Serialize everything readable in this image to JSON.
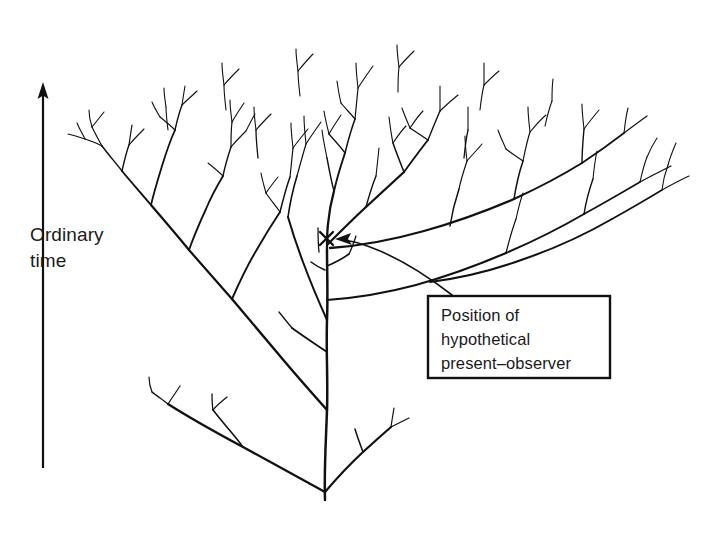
{
  "figure": {
    "background_color": "#ffffff",
    "ink_color": "#111111",
    "width": 712,
    "height": 537
  },
  "time_axis": {
    "label": "Ordinary\ntime",
    "label_line_1": "Ordinary",
    "label_line_2": "time",
    "direction": "upward",
    "arrow_icon": "up-arrow-icon",
    "x": 43,
    "y_top": 85,
    "y_bottom": 468
  },
  "observer_marker": {
    "symbol": "x-marker-icon",
    "x": 326,
    "y": 238,
    "size": 13
  },
  "callout": {
    "line_1": "Position of",
    "line_2": "hypothetical",
    "line_3": "present–observer",
    "text": "Position of\nhypothetical\npresent–observer",
    "box": {
      "x": 428,
      "y": 296,
      "width": 182,
      "height": 82
    },
    "pointer_icon": "curved-arrow-icon"
  },
  "tree": {
    "root": {
      "x": 325,
      "y": 492
    },
    "description": "recursive binary branching tree, fanning upward and outward",
    "trunk_stroke_width": 2.4,
    "twig_stroke_width": 1.1,
    "canopy_top_y": 30,
    "leftmost_x": 62,
    "rightmost_x": 692
  }
}
